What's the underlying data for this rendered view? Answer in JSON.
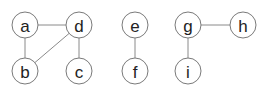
{
  "diagram": {
    "type": "undirected-graph",
    "node_radius": 13,
    "colors": {
      "edge": "#8a8a8a",
      "node_stroke": "#7a7a7a",
      "node_fill": "#ffffff",
      "label": "#222222"
    },
    "nodes": [
      {
        "id": "a",
        "label": "a",
        "x": 25,
        "y": 25
      },
      {
        "id": "d",
        "label": "d",
        "x": 79,
        "y": 25
      },
      {
        "id": "b",
        "label": "b",
        "x": 25,
        "y": 71
      },
      {
        "id": "c",
        "label": "c",
        "x": 79,
        "y": 71
      },
      {
        "id": "e",
        "label": "e",
        "x": 135,
        "y": 25
      },
      {
        "id": "f",
        "label": "f",
        "x": 135,
        "y": 71
      },
      {
        "id": "g",
        "label": "g",
        "x": 188,
        "y": 25
      },
      {
        "id": "h",
        "label": "h",
        "x": 243,
        "y": 25
      },
      {
        "id": "i",
        "label": "i",
        "x": 188,
        "y": 71
      }
    ],
    "edges": [
      [
        "a",
        "d"
      ],
      [
        "a",
        "b"
      ],
      [
        "d",
        "b"
      ],
      [
        "d",
        "c"
      ],
      [
        "e",
        "f"
      ],
      [
        "g",
        "h"
      ],
      [
        "g",
        "i"
      ]
    ]
  }
}
